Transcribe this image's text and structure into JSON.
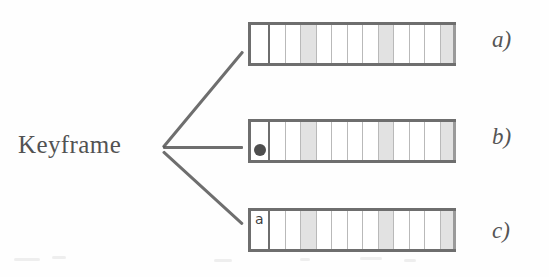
{
  "figure": {
    "keyframe_label": "Keyframe",
    "background_color": "#fefefe",
    "line_color": "#5a5a5a",
    "strip_border_color": "#6e6e6e",
    "cell_border_color": "#b9b9b9",
    "shaded_cell_color": "#e2e2e2",
    "marker_dot_color": "#4e4e4e"
  },
  "panels": [
    {
      "id": "a",
      "letter": "a)",
      "keyframe_style": "plain",
      "keyframe_content": "",
      "cell_count": 13,
      "shaded_cells": [
        4,
        9,
        13
      ]
    },
    {
      "id": "b",
      "letter": "b)",
      "keyframe_style": "shaded-dot",
      "keyframe_content": "",
      "cell_count": 13,
      "shaded_cells": [
        4,
        9,
        13
      ]
    },
    {
      "id": "c",
      "letter": "c)",
      "keyframe_style": "glyph",
      "keyframe_content": "a",
      "cell_count": 13,
      "shaded_cells": [
        4,
        9,
        13
      ]
    }
  ],
  "connectors": [
    {
      "name": "keyframe-to-panel-a",
      "x1": 163,
      "y1": 146,
      "x2": 243,
      "y2": 50
    },
    {
      "name": "keyframe-to-panel-b",
      "x1": 163,
      "y1": 146,
      "x2": 243,
      "y2": 146
    },
    {
      "name": "keyframe-to-panel-c",
      "x1": 163,
      "y1": 150,
      "x2": 243,
      "y2": 223
    }
  ],
  "layout": {
    "strip_left": 248,
    "strip_width": 208,
    "strip_height": 44,
    "keycell_width": 22,
    "strip_tops": [
      22,
      119,
      208
    ],
    "letter_left": 492,
    "letter_tops": [
      27,
      124,
      218
    ]
  }
}
